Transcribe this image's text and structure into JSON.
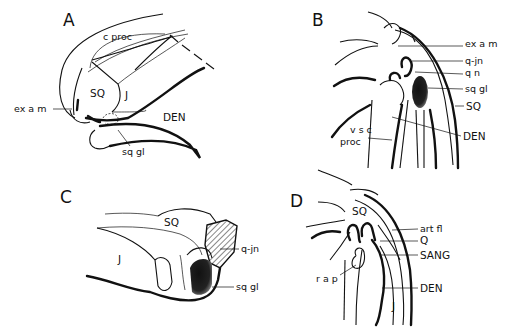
{
  "figure": {
    "panels": [
      {
        "id": "A",
        "letter": "A",
        "labels": [
          "c proc",
          "SQ",
          "J",
          "ex a m",
          "DEN",
          "sq gl"
        ]
      },
      {
        "id": "B",
        "letter": "B",
        "labels": [
          "ex a m",
          "q-jn",
          "q n",
          "sq gl",
          "SQ",
          "DEN",
          "v s c",
          "proc"
        ]
      },
      {
        "id": "C",
        "letter": "C",
        "labels": [
          "SQ",
          "J",
          "q-jn",
          "sq gl"
        ]
      },
      {
        "id": "D",
        "letter": "D",
        "labels": [
          "SQ",
          "art fl",
          "Q",
          "SANG",
          "r a p",
          "DEN",
          "J"
        ]
      }
    ],
    "colors": {
      "ink": "#111111",
      "background": "#ffffff"
    }
  }
}
